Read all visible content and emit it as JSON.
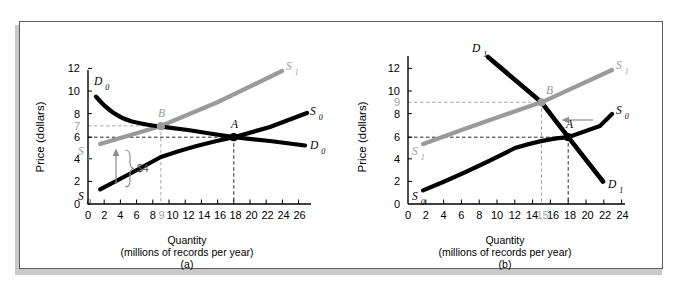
{
  "figure": {
    "panels": [
      "a",
      "b"
    ]
  },
  "panel_a": {
    "id": "(a)",
    "axis_title_line1": "Quantity",
    "axis_title_line2": "(millions of records per year)",
    "ylabel": "Price (dollars)",
    "yticks": [
      "0",
      "2",
      "4",
      "6",
      "8",
      "10",
      "12"
    ],
    "ytick_highlight": "7",
    "xticks": [
      "0",
      "2",
      "4",
      "6",
      "8",
      "10",
      "12",
      "14",
      "16",
      "18",
      "20",
      "22",
      "24",
      "26"
    ],
    "xtick_highlight": "9",
    "labels": {
      "demand_left": "D0",
      "demand_right": "D0",
      "supply0_left": "S0",
      "supply0_right": "S0",
      "supply1_left": "S1",
      "supply1_right": "S1",
      "point_a": "A",
      "point_b": "B",
      "shift_amount": "$4"
    },
    "annotation_arrow": "up-arrow-shift"
  },
  "panel_b": {
    "id": "(b)",
    "axis_title_line1": "Quantity",
    "axis_title_line2": "(millions of records per year)",
    "ylabel": "Price (dollars)",
    "yticks": [
      "0",
      "2",
      "4",
      "6",
      "8",
      "10",
      "12"
    ],
    "ytick_highlight": "9",
    "xticks": [
      "0",
      "2",
      "4",
      "6",
      "8",
      "10",
      "12",
      "14",
      "16",
      "18",
      "20",
      "22",
      "24"
    ],
    "xtick_highlight": "15",
    "labels": {
      "demand_top": "D1",
      "demand_bottom": "D1",
      "supply0_left": "S0",
      "supply0_right": "S0",
      "supply1_left": "S1",
      "supply1_right": "S1",
      "point_a": "A",
      "point_b": "B"
    },
    "annotation_arrow": "left-arrow-shift"
  },
  "colors": {
    "curve_black": "#000000",
    "curve_gray": "#9a9a9a",
    "dashed_black": "#222222",
    "dashed_gray": "#a8a8a8",
    "frame_border": "#5d5d5d",
    "shadow": "#c9c9c9",
    "background": "#ffffff"
  },
  "chart_data": [
    {
      "type": "line",
      "panel": "(a)",
      "title": "Effect of a $4 increase in supply cost",
      "xlabel": "Quantity (millions of records per year)",
      "ylabel": "Price (dollars)",
      "xlim": [
        0,
        27
      ],
      "ylim": [
        0,
        13
      ],
      "grid": false,
      "legend": "inline curve labels",
      "series": [
        {
          "name": "D0",
          "style": "solid-black-curved",
          "points": [
            [
              1,
              9.5
            ],
            [
              2,
              8.6
            ],
            [
              3,
              8.1
            ],
            [
              5,
              7.5
            ],
            [
              7,
              7.2
            ],
            [
              9,
              7.0
            ],
            [
              12,
              6.7
            ],
            [
              15,
              6.4
            ],
            [
              18,
              6.0
            ],
            [
              22,
              5.6
            ],
            [
              26,
              5.2
            ]
          ]
        },
        {
          "name": "S0",
          "style": "solid-black",
          "points": [
            [
              1.5,
              1.3
            ],
            [
              6,
              3.0
            ],
            [
              10,
              4.2
            ],
            [
              14,
              5.2
            ],
            [
              18,
              6.0
            ],
            [
              22,
              7.8
            ],
            [
              26,
              9.5
            ]
          ]
        },
        {
          "name": "S1",
          "style": "solid-gray",
          "points": [
            [
              1.5,
              5.3
            ],
            [
              9,
              7.0
            ],
            [
              16,
              9.1
            ],
            [
              24,
              11.8
            ]
          ]
        }
      ],
      "points_of_interest": [
        {
          "label": "A",
          "x": 18,
          "y": 6,
          "color": "#000000"
        },
        {
          "label": "B",
          "x": 9,
          "y": 7,
          "color": "#9a9a9a"
        }
      ],
      "reference_lines": [
        {
          "axis": "y",
          "value": 6,
          "color": "#222222",
          "style": "dashed"
        },
        {
          "axis": "y",
          "value": 7,
          "color": "#a8a8a8",
          "style": "dashed"
        },
        {
          "axis": "x",
          "value": 9,
          "color": "#a8a8a8",
          "style": "dashed"
        },
        {
          "axis": "x",
          "value": 18,
          "color": "#222222",
          "style": "dashed"
        }
      ],
      "annotations": [
        {
          "text": "$4",
          "type": "brace-with-up-arrow",
          "from_y": 1.8,
          "to_y": 5.2,
          "at_x": 3
        }
      ]
    },
    {
      "type": "line",
      "panel": "(b)",
      "title": "Effect of a decrease in demand with higher supply curve",
      "xlabel": "Quantity (millions of records per year)",
      "ylabel": "Price (dollars)",
      "xlim": [
        0,
        25
      ],
      "ylim": [
        0,
        13
      ],
      "grid": false,
      "legend": "inline curve labels",
      "series": [
        {
          "name": "S0",
          "style": "solid-black",
          "points": [
            [
              1.7,
              1.2
            ],
            [
              6,
              3.1
            ],
            [
              10,
              4.3
            ],
            [
              14,
              5.2
            ],
            [
              18,
              6.0
            ],
            [
              23,
              8.0
            ]
          ]
        },
        {
          "name": "S1",
          "style": "solid-gray",
          "points": [
            [
              1.7,
              5.3
            ],
            [
              8,
              7.3
            ],
            [
              15,
              9.0
            ],
            [
              23,
              11.8
            ]
          ]
        },
        {
          "name": "D1",
          "style": "solid-black-steep",
          "points": [
            [
              9,
              13.0
            ],
            [
              15,
              9.0
            ],
            [
              18,
              6.0
            ],
            [
              22,
              2.0
            ]
          ]
        }
      ],
      "points_of_interest": [
        {
          "label": "A",
          "x": 18,
          "y": 6,
          "color": "#000000"
        },
        {
          "label": "B",
          "x": 15,
          "y": 9,
          "color": "#9a9a9a"
        }
      ],
      "reference_lines": [
        {
          "axis": "y",
          "value": 6,
          "color": "#222222",
          "style": "dashed"
        },
        {
          "axis": "y",
          "value": 9,
          "color": "#a8a8a8",
          "style": "dashed"
        },
        {
          "axis": "x",
          "value": 15,
          "color": "#a8a8a8",
          "style": "dashed"
        },
        {
          "axis": "x",
          "value": 18,
          "color": "#222222",
          "style": "dashed"
        }
      ],
      "annotations": [
        {
          "text": "",
          "type": "left-arrow",
          "at_y": 7.4,
          "from_x": 22,
          "to_x": 19
        }
      ]
    }
  ]
}
